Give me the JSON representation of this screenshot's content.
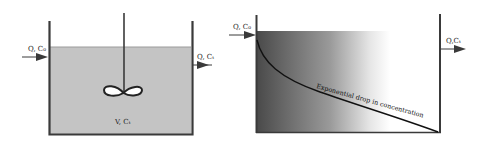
{
  "diagram": {
    "cstr": {
      "inlet_label": "Q, C₀",
      "outlet_label": "Q, Cₜ",
      "volume_label": "V, Cₜ",
      "liquid_color": "#c4c4c4",
      "wall_color": "#3a3a3a"
    },
    "pfr": {
      "inlet_label": "Q, C₀",
      "outlet_label": "Q,Cₜ",
      "curve_label": "Exponential drop in concentration",
      "gradient_dark": "#4a4a4a",
      "gradient_light": "#ffffff",
      "wall_color": "#3a3a3a"
    }
  }
}
